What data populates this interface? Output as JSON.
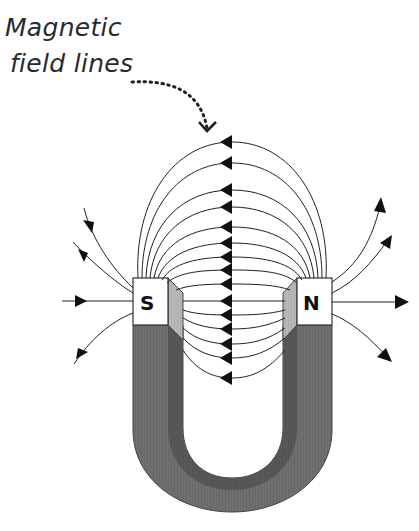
{
  "annotation": {
    "line1": "Magnetic",
    "line2": "field lines",
    "leader_style": "dotted curved arrow"
  },
  "magnet": {
    "type": "horseshoe",
    "left_pole": "S",
    "right_pole": "N",
    "body_color": "#6e6e6e",
    "inner_stripe_color": "#555555",
    "pole_face_color": "#ffffff",
    "bevel_color": "#b5b5b5"
  },
  "field_lines": {
    "direction": "N to S",
    "inner_arc_count": 15,
    "outer_left_arrows": 4,
    "outer_right_arrows": 4
  }
}
